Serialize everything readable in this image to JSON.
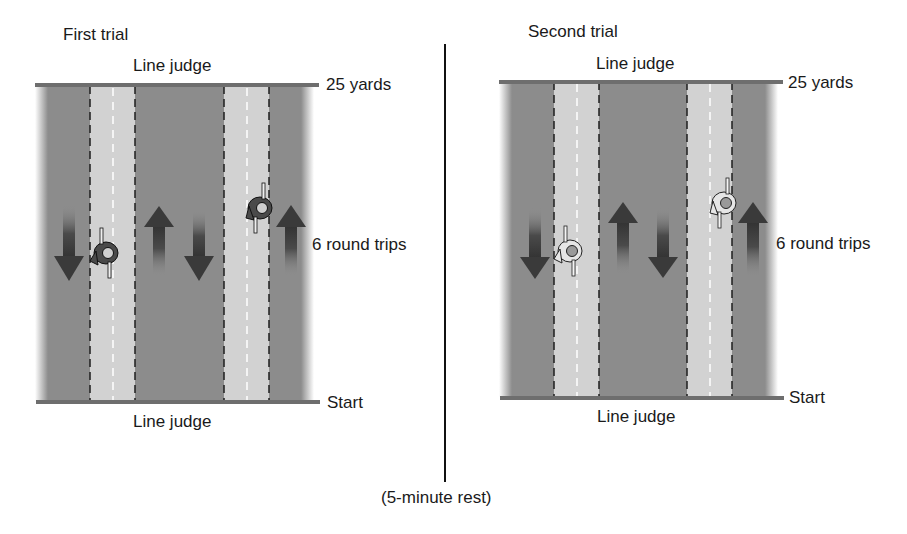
{
  "colors": {
    "pool_dark": "#8c8c8c",
    "lane_light": "#d2d2d2",
    "end_line": "#6e6e6e",
    "dashed_line": "#1e1e1e",
    "arrow_dark": "#3c3c3c",
    "divider": "#111111",
    "swimmer_dark": "#4a4a4a",
    "swimmer_light": "#e6e6e6"
  },
  "first_trial": {
    "title": "First trial",
    "top_judge": "Line judge",
    "bottom_judge": "Line judge",
    "top_end_label": "25 yards",
    "bottom_end_label": "Start",
    "trips_label": "6 round trips"
  },
  "second_trial": {
    "title": "Second trial",
    "top_judge": "Line judge",
    "bottom_judge": "Line judge",
    "top_end_label": "25 yards",
    "bottom_end_label": "Start",
    "trips_label": "6 round trips"
  },
  "rest_label": "(5-minute rest)",
  "arrows": {
    "directions_per_trial": [
      "down",
      "up",
      "down",
      "up"
    ]
  }
}
